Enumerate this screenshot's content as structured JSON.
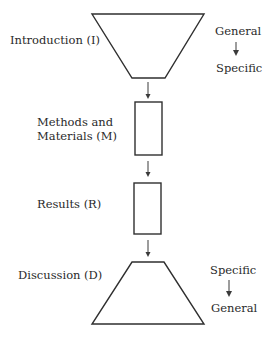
{
  "diagram": {
    "sections": [
      {
        "id": "I",
        "label": "Introduction (I)",
        "shape": "inverted-trapezoid"
      },
      {
        "id": "M",
        "label_line1": "Methods and",
        "label_line2": "Materials (M)",
        "shape": "rectangle"
      },
      {
        "id": "R",
        "label": "Results (R)",
        "shape": "rectangle"
      },
      {
        "id": "D",
        "label": "Discussion (D)",
        "shape": "trapezoid"
      }
    ],
    "intro_scope": {
      "from": "General",
      "to": "Specific"
    },
    "discussion_scope": {
      "from": "Specific",
      "to": "General"
    },
    "colors": {
      "stroke": "#2f2f2f",
      "text": "#2a2a2a",
      "background": "#ffffff"
    }
  }
}
